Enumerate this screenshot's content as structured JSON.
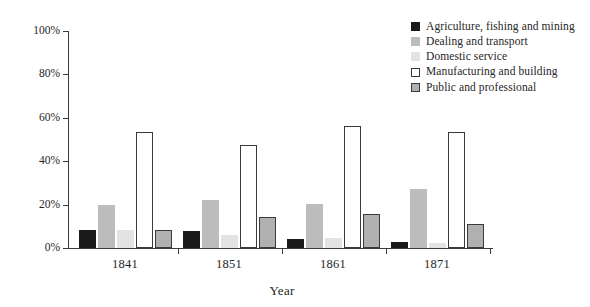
{
  "chart_data": {
    "type": "bar",
    "title": "",
    "subtitle": "",
    "xlabel": "Year",
    "ylabel": "",
    "categories": [
      "1841",
      "1851",
      "1861",
      "1871"
    ],
    "ylim": [
      0,
      100
    ],
    "y_ticks": [
      "0%",
      "20%",
      "40%",
      "60%",
      "80%",
      "100%"
    ],
    "y_tick_values": [
      0,
      20,
      40,
      60,
      80,
      100
    ],
    "grid": false,
    "legend_position": "top-right",
    "series": [
      {
        "name": "Agriculture, fishing and mining",
        "swatch": "solid-black",
        "fill": "#1a1a1a",
        "stroke": "#1a1a1a",
        "values": [
          8.5,
          8,
          4,
          3
        ]
      },
      {
        "name": "Dealing and transport",
        "swatch": "solid-mid-gray",
        "fill": "#bcbcbc",
        "stroke": "#bcbcbc",
        "values": [
          20,
          22,
          20.5,
          27
        ]
      },
      {
        "name": "Domestic service",
        "swatch": "solid-light-gray",
        "fill": "#e3e3e3",
        "stroke": "#e3e3e3",
        "values": [
          8.5,
          6,
          4.5,
          2.5
        ]
      },
      {
        "name": "Manufacturing and building",
        "swatch": "outlined-white",
        "fill": "#ffffff",
        "stroke": "#3a3a3a",
        "values": [
          53.5,
          47.5,
          56,
          53.5
        ]
      },
      {
        "name": "Public and professional",
        "swatch": "outlined-gray",
        "fill": "#b0b0b0",
        "stroke": "#3a3a3a",
        "values": [
          8.5,
          14.5,
          15.5,
          11
        ]
      }
    ]
  }
}
